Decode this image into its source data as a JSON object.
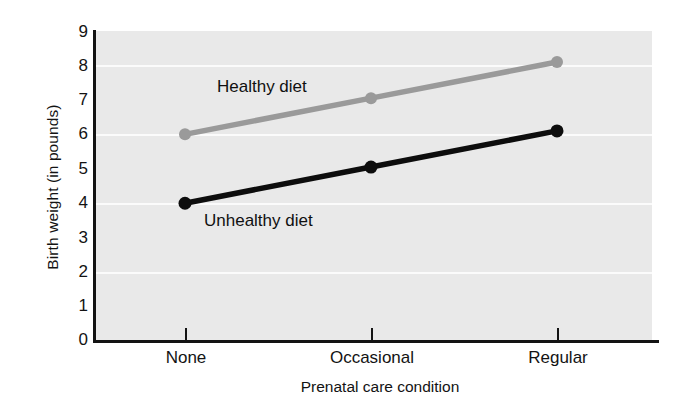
{
  "chart_data": {
    "type": "line",
    "title": "",
    "xlabel": "Prenatal care condition",
    "ylabel": "Birth weight (in pounds)",
    "categories": [
      "None",
      "Occasional",
      "Regular"
    ],
    "series": [
      {
        "name": "Healthy diet",
        "values": [
          6.0,
          7.05,
          8.1
        ],
        "color": "#9a9a9a",
        "annotation": "Healthy diet"
      },
      {
        "name": "Unhealthy diet",
        "values": [
          4.0,
          5.05,
          6.1
        ],
        "color": "#0d0d0d",
        "annotation": "Unhealthy diet"
      }
    ],
    "ylim": [
      0,
      9
    ],
    "ytick_labels": [
      "9",
      "8",
      "7",
      "6",
      "5",
      "4",
      "3",
      "2",
      "1",
      "0"
    ],
    "ytick_values": [
      9,
      8,
      7,
      6,
      5,
      4,
      3,
      2,
      1,
      0
    ],
    "ytick_marks_at": [
      8,
      6,
      4,
      2
    ],
    "gridlines_at": [
      8,
      6,
      4,
      2
    ],
    "grid": true,
    "grid_color": "#fbfbfb",
    "plot_background": "#e9e9e9",
    "legend": "inline-annotations",
    "legend_position": "inline"
  },
  "axes": {
    "y_title": "Birth weight (in pounds)",
    "x_title": "Prenatal care condition"
  }
}
